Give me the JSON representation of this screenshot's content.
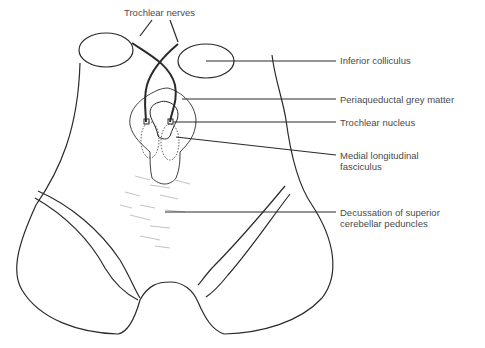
{
  "diagram": {
    "colors": {
      "line": "#2a2a2a",
      "text": "#4a4a4a",
      "background": "#ffffff"
    },
    "labels": {
      "trochlear_nerves": "Trochlear nerves",
      "inferior_colliculus": "Inferior colliculus",
      "periaqueductal_grey": "Periaqueductal grey matter",
      "trochlear_nucleus": "Trochlear nucleus",
      "mlf": "Medial longitudinal\nfasciculus",
      "decussation": "Decussation of superior\ncerebellar peduncles"
    }
  }
}
